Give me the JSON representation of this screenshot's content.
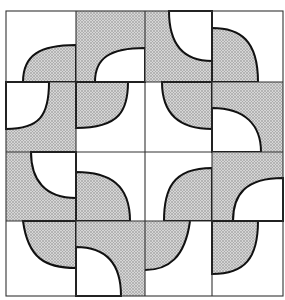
{
  "diagram": {
    "type": "tiling-pattern",
    "grid": {
      "rows": 4,
      "cols": 4
    },
    "colors": {
      "shade": "#b8b8b8",
      "line": "#111111",
      "background": "#ffffff"
    }
  }
}
